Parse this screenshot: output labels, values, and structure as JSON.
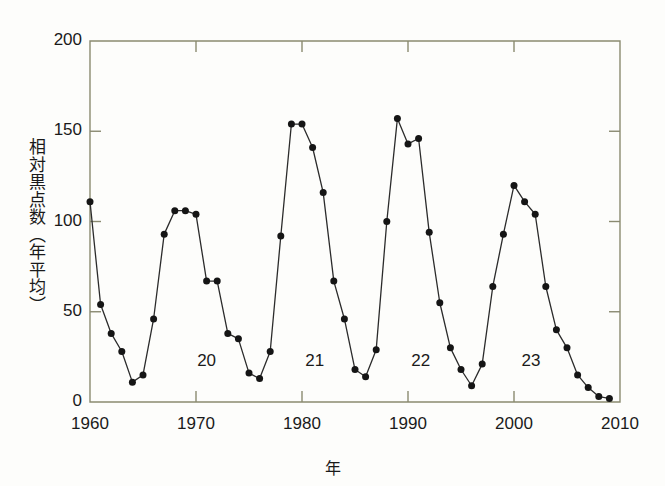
{
  "figure": {
    "background_color": "#fdfdfb",
    "axis_color": "#8a8a70",
    "line_color": "#2b2b2b",
    "marker_color": "#151515",
    "text_color": "#1a1a1a"
  },
  "chart_data": {
    "type": "line",
    "title": "",
    "xlabel": "年",
    "ylabel": "相対黒点数（年平均）",
    "xlim": [
      1960,
      2010
    ],
    "ylim": [
      0,
      200
    ],
    "xticks": [
      1960,
      1970,
      1980,
      1990,
      2000,
      2010
    ],
    "xtick_labels": [
      "1960",
      "1970",
      "1980",
      "1990",
      "2000",
      "2010"
    ],
    "yticks": [
      0,
      50,
      100,
      150,
      200
    ],
    "ytick_labels": [
      "0",
      "50",
      "100",
      "150",
      "200"
    ],
    "grid": false,
    "legend": "none",
    "marker": "filled-circle",
    "x": [
      1960,
      1961,
      1962,
      1963,
      1964,
      1965,
      1966,
      1967,
      1968,
      1969,
      1970,
      1971,
      1972,
      1973,
      1974,
      1975,
      1976,
      1977,
      1978,
      1979,
      1980,
      1981,
      1982,
      1983,
      1984,
      1985,
      1986,
      1987,
      1988,
      1989,
      1990,
      1991,
      1992,
      1993,
      1994,
      1995,
      1996,
      1997,
      1998,
      1999,
      2000,
      2001,
      2002,
      2003,
      2004,
      2005,
      2006,
      2007,
      2008,
      2009
    ],
    "values": [
      111,
      54,
      38,
      28,
      11,
      15,
      46,
      93,
      106,
      106,
      104,
      67,
      67,
      38,
      35,
      16,
      13,
      28,
      92,
      154,
      154,
      141,
      116,
      67,
      46,
      18,
      14,
      29,
      100,
      157,
      143,
      146,
      94,
      55,
      30,
      18,
      9,
      21,
      64,
      93,
      120,
      111,
      104,
      64,
      40,
      30,
      15,
      8,
      3,
      2
    ],
    "annotations": [
      {
        "label": "20",
        "x": 1971.0,
        "y": 22,
        "meaning": "solar-cycle-20"
      },
      {
        "label": "21",
        "x": 1981.2,
        "y": 22,
        "meaning": "solar-cycle-21"
      },
      {
        "label": "22",
        "x": 1991.2,
        "y": 22,
        "meaning": "solar-cycle-22"
      },
      {
        "label": "23",
        "x": 2001.6,
        "y": 22,
        "meaning": "solar-cycle-23"
      }
    ]
  }
}
